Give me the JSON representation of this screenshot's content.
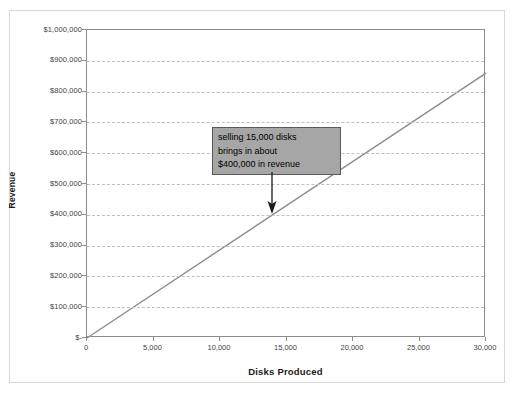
{
  "chart_data": {
    "type": "line",
    "title": "",
    "xlabel": "Disks Produced",
    "ylabel": "Revenue",
    "xlim": [
      0,
      30000
    ],
    "ylim": [
      0,
      1000000
    ],
    "grid": true,
    "legend": "none",
    "x_tick_labels": [
      "0",
      "5,000",
      "10,000",
      "15,000",
      "20,000",
      "25,000",
      "30,000"
    ],
    "x_ticks": [
      0,
      5000,
      10000,
      15000,
      20000,
      25000,
      30000
    ],
    "y_tick_labels": [
      "$-",
      "$100,000",
      "$200,000",
      "$300,000",
      "$400,000",
      "$500,000",
      "$600,000",
      "$700,000",
      "$800,000",
      "$900,000",
      "$1,000,000"
    ],
    "y_ticks": [
      0,
      100000,
      200000,
      300000,
      400000,
      500000,
      600000,
      700000,
      800000,
      900000,
      1000000
    ],
    "series": [
      {
        "name": "Revenue",
        "color": "#8c8c8c",
        "x": [
          0,
          30000
        ],
        "values": [
          0,
          860000
        ]
      }
    ],
    "annotations": [
      {
        "lines": [
          "selling 15,000 disks",
          "brings in about",
          "$400,000 in revenue"
        ],
        "points_to_x": 14000,
        "points_to_y": 400000,
        "box_fill": "#a6a6a6",
        "box_border": "#595959"
      }
    ]
  },
  "colors": {
    "background": "#ffffff",
    "frame": "#d9d9d9",
    "axis": "#8c8c8c",
    "gridline": "#bfbfbf",
    "series": "#8c8c8c",
    "text": "#1a1a1a"
  }
}
